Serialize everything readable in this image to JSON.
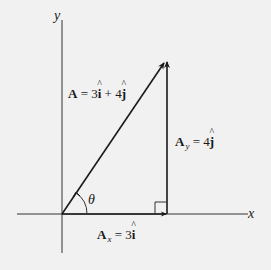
{
  "diagram": {
    "type": "vector-decomposition",
    "axes": {
      "x_label": "x",
      "y_label": "y"
    },
    "vector_A": {
      "name": "A",
      "equals": " = 3",
      "i_hat": "i",
      "plus": " + 4",
      "j_hat": "j"
    },
    "component_y": {
      "name": "A",
      "subscript": "y",
      "equals": " = 4",
      "j_hat": "j"
    },
    "component_x": {
      "name": "A",
      "subscript": "x",
      "equals": " = 3",
      "i_hat": "i"
    },
    "angle_label": "θ",
    "right_angle_marker": true,
    "colors": {
      "background": "#f1f1f1",
      "ink": "#1a1a1a"
    }
  }
}
